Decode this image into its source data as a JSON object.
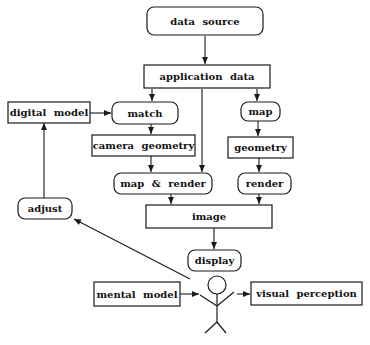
{
  "diagram": {
    "type": "flowchart",
    "nodes": {
      "data_source": {
        "label": "data source",
        "shape": "rounded"
      },
      "application_data": {
        "label": "application data",
        "shape": "rect"
      },
      "digital_model": {
        "label": "digital model",
        "shape": "rect"
      },
      "match": {
        "label": "match",
        "shape": "rounded"
      },
      "map": {
        "label": "map",
        "shape": "rounded"
      },
      "camera_geometry": {
        "label": "camera geometry",
        "shape": "rect"
      },
      "geometry": {
        "label": "geometry",
        "shape": "rect"
      },
      "map_render": {
        "label": "map & render",
        "shape": "rounded"
      },
      "render": {
        "label": "render",
        "shape": "rounded"
      },
      "adjust": {
        "label": "adjust",
        "shape": "rounded"
      },
      "image": {
        "label": "image",
        "shape": "rect"
      },
      "display": {
        "label": "display",
        "shape": "rounded"
      },
      "mental_model": {
        "label": "mental model",
        "shape": "rect"
      },
      "visual_perception": {
        "label": "visual perception",
        "shape": "rect"
      },
      "user": {
        "label": "",
        "shape": "stick-figure"
      }
    },
    "edges": [
      {
        "from": "data source",
        "to": "application data"
      },
      {
        "from": "application data",
        "to": "match"
      },
      {
        "from": "application data",
        "to": "map & render"
      },
      {
        "from": "application data",
        "to": "map"
      },
      {
        "from": "digital model",
        "to": "match"
      },
      {
        "from": "match",
        "to": "camera geometry"
      },
      {
        "from": "camera geometry",
        "to": "map & render"
      },
      {
        "from": "map",
        "to": "geometry"
      },
      {
        "from": "geometry",
        "to": "render"
      },
      {
        "from": "map & render",
        "to": "image"
      },
      {
        "from": "render",
        "to": "image"
      },
      {
        "from": "image",
        "to": "display"
      },
      {
        "from": "adjust",
        "to": "digital model"
      },
      {
        "from": "user",
        "to": "adjust"
      },
      {
        "from": "mental model",
        "to": "user"
      },
      {
        "from": "user",
        "to": "visual perception"
      }
    ]
  }
}
